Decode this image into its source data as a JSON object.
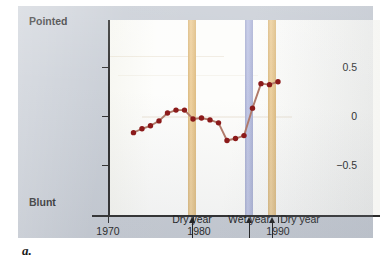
{
  "figure": {
    "caption": "a.",
    "panel_bg": "#c9ced6",
    "plot_bg": "#fdfdfb"
  },
  "chart_data": {
    "type": "line",
    "title": "",
    "subtitle": "",
    "xlabel": "",
    "ylabel": "",
    "xlim": [
      1972,
      1991
    ],
    "ylim": [
      -0.85,
      0.85
    ],
    "grid": false,
    "legend": null,
    "axis_end_labels": {
      "y_top": "Pointed",
      "y_bottom": "Blunt"
    },
    "y_ticks": [
      {
        "value": 0.5,
        "label": "0.5"
      },
      {
        "value": 0.0,
        "label": "0"
      },
      {
        "value": -0.5,
        "label": "−0.5"
      }
    ],
    "x_ticks": [
      {
        "value": 1970,
        "label": "1970"
      },
      {
        "value": 1980,
        "label": "1980"
      },
      {
        "value": 1990,
        "label": "1990"
      }
    ],
    "series": [
      {
        "name": "Beak shape index",
        "line_color": "#b07a6a",
        "marker_color": "#8b1a1a",
        "x": [
          1973,
          1974,
          1975,
          1976,
          1977,
          1978,
          1979,
          1980,
          1981,
          1982,
          1983,
          1984,
          1985,
          1986,
          1987,
          1988,
          1989,
          1990
        ],
        "values": [
          -0.17,
          -0.13,
          -0.1,
          -0.05,
          0.03,
          0.06,
          0.06,
          -0.03,
          -0.02,
          -0.04,
          -0.07,
          -0.25,
          -0.23,
          -0.2,
          0.08,
          0.33,
          0.32,
          0.35
        ]
      }
    ],
    "event_bands": [
      {
        "label": "Dry year",
        "color": "#ecc88a",
        "x_start": 1977.2,
        "x_end": 1978.0,
        "arrow_x": 1977.6
      },
      {
        "label": "Wet year",
        "color": "#b6bde2",
        "x_start": 1983.8,
        "x_end": 1984.6,
        "arrow_x": 1984.2
      },
      {
        "label": "Dry year",
        "color": "#ecc88a",
        "x_start": 1986.5,
        "x_end": 1987.3,
        "arrow_x": 1986.9
      }
    ],
    "annotations": [
      {
        "text": "Dry year",
        "x": 1977.6
      },
      {
        "text": "Wet year",
        "x": 1984.2
      },
      {
        "text": "Dry year",
        "x": 1986.9
      }
    ]
  }
}
